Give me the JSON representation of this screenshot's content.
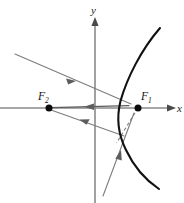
{
  "figure": {
    "background_color": "#ffffff",
    "width": 184,
    "height": 203
  },
  "axes": {
    "x_axis": {
      "label": "x",
      "label_position": {
        "x": 177,
        "y": 112
      },
      "start": {
        "x": 0,
        "y": 108
      },
      "end": {
        "x": 176,
        "y": 108
      },
      "arrow": "right",
      "color": "#8a8a8a"
    },
    "y_axis": {
      "label": "y",
      "label_position": {
        "x": 91,
        "y": 13
      },
      "start": {
        "x": 95,
        "y": 203
      },
      "end": {
        "x": 95,
        "y": 18
      },
      "arrow": "up",
      "color": "#8a8a8a"
    },
    "origin": {
      "x": 95,
      "y": 108
    }
  },
  "curve": {
    "name": "hyperbola-right-branch",
    "color": "#111111",
    "vertex": {
      "x": 118,
      "y": 108
    },
    "path": "M 160,28 C 140,50 126,78 120,101 C 116,118 118,134 126,150 C 134,166 146,180 158,188",
    "stroke_width": 2.1
  },
  "foci": [
    {
      "id": "F1",
      "label": "F",
      "subscript": "1",
      "point": {
        "x": 138,
        "y": 108
      },
      "label_position": {
        "x": 140,
        "y": 99
      },
      "dot_radius": 3.4,
      "color": "#0c0c0c"
    },
    {
      "id": "F2",
      "label": "F",
      "subscript": "2",
      "point": {
        "x": 49,
        "y": 108
      },
      "label_position": {
        "x": 38,
        "y": 99
      },
      "dot_radius": 3.4,
      "color": "#0c0c0c"
    }
  ],
  "rays": [
    {
      "name": "incoming-ray-upper-left",
      "description": "incident ray arriving from upper left toward the curve near F1",
      "from": {
        "x": 15,
        "y": 54
      },
      "to": {
        "x": 131,
        "y": 104
      },
      "style": "solid",
      "color": "#7c7c7c",
      "arrow_at": {
        "x": 72,
        "y": 79
      },
      "arrow_direction": "down-right"
    },
    {
      "name": "reflected-ray-to-focus-2",
      "description": "ray along x-direction from curve back toward F2",
      "from": {
        "x": 128,
        "y": 106
      },
      "to": {
        "x": 51,
        "y": 108
      },
      "style": "solid",
      "color": "#5d5d5d",
      "arrow_at": {
        "x": 88,
        "y": 107
      },
      "arrow_direction": "left"
    },
    {
      "name": "incoming-ray-lower",
      "description": "second ray from curve region back toward F2, lower branch",
      "from": {
        "x": 123,
        "y": 135
      },
      "to": {
        "x": 51,
        "y": 110
      },
      "style": "solid",
      "color": "#7c7c7c",
      "arrow_at": {
        "x": 83,
        "y": 121
      },
      "arrow_direction": "up-left"
    },
    {
      "name": "incident-ray-steep-lower",
      "description": "steep ray from lower left rising toward the curve and F1",
      "from": {
        "x": 103,
        "y": 196
      },
      "to": {
        "x": 133,
        "y": 115
      },
      "style": "solid",
      "color": "#7c7c7c",
      "arrow_at": {
        "x": 119,
        "y": 153
      },
      "arrow_direction": "up-right"
    },
    {
      "name": "tangent-dashed-segment",
      "description": "dashed line from F1 down-left across the curve",
      "from": {
        "x": 138,
        "y": 108
      },
      "to": {
        "x": 117,
        "y": 142
      },
      "style": "dashed",
      "color": "#7c7c7c"
    }
  ],
  "legend": {
    "visible": false,
    "entries": []
  }
}
